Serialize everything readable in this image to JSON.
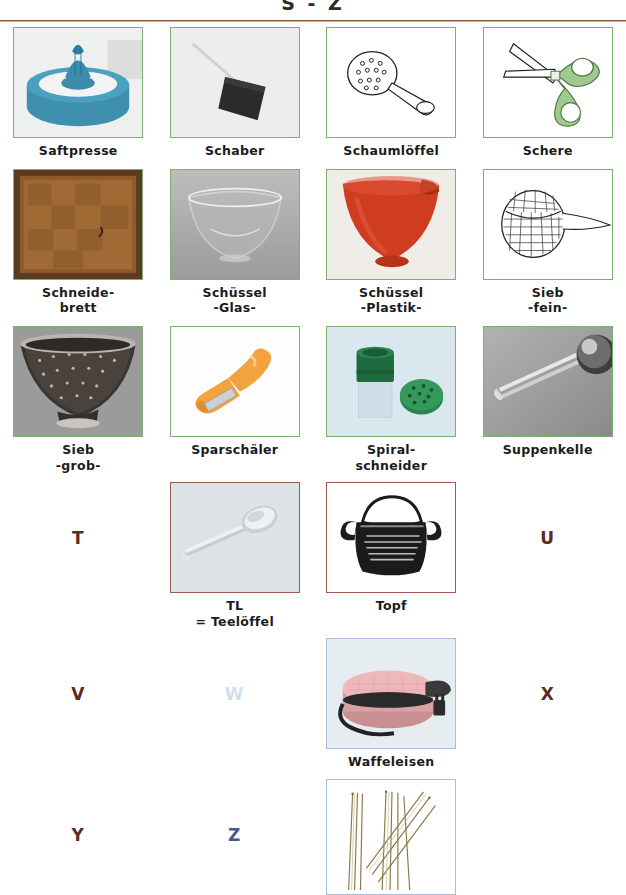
{
  "header": {
    "title": "S - Z"
  },
  "colors": {
    "frame_green": "#7fae74",
    "frame_brown": "#9c5b4e",
    "frame_blue": "#a8bed8",
    "rule_brown": "#8a5a3b",
    "letter_brown": "#5a2d22",
    "letter_blue_pale": "#cfe0f0",
    "letter_blue_dark": "#4a5a85",
    "caption_text": "#1b1b1b"
  },
  "rows": [
    {
      "cells": [
        {
          "kind": "image",
          "caption": "Saftpresse",
          "caption2": "",
          "border": "green",
          "art": "citrus-juicer"
        },
        {
          "kind": "image",
          "caption": "Schaber",
          "caption2": "",
          "border": "green",
          "art": "scraper"
        },
        {
          "kind": "image",
          "caption": "Schaumlöffel",
          "caption2": "",
          "border": "green",
          "art": "skimmer-spoon"
        },
        {
          "kind": "image",
          "caption": "Schere",
          "caption2": "",
          "border": "green",
          "art": "scissors"
        }
      ]
    },
    {
      "cells": [
        {
          "kind": "image",
          "caption": "Schneide-",
          "caption2": "brett",
          "border": "green",
          "art": "cutting-board"
        },
        {
          "kind": "image",
          "caption": "Schüssel",
          "caption2": "-Glas-",
          "border": "green",
          "art": "glass-bowl"
        },
        {
          "kind": "image",
          "caption": "Schüssel",
          "caption2": "-Plastik-",
          "border": "green",
          "art": "plastic-bowl"
        },
        {
          "kind": "image",
          "caption": "Sieb",
          "caption2": "-fein-",
          "border": "green",
          "art": "fine-sieve"
        }
      ]
    },
    {
      "cells": [
        {
          "kind": "image",
          "caption": "Sieb",
          "caption2": "-grob-",
          "border": "green",
          "art": "colander"
        },
        {
          "kind": "image",
          "caption": "Sparschäler",
          "caption2": "",
          "border": "green",
          "art": "peeler"
        },
        {
          "kind": "image",
          "caption": "Spiral-",
          "caption2": "schneider",
          "border": "green",
          "art": "spiral-cutter"
        },
        {
          "kind": "image",
          "caption": "Suppenkelle",
          "caption2": "",
          "border": "green",
          "art": "ladle"
        }
      ]
    },
    {
      "cells": [
        {
          "kind": "letter",
          "letter": "T",
          "color": "brown"
        },
        {
          "kind": "image",
          "caption": "TL",
          "caption2": "= Teelöffel",
          "border": "brown",
          "art": "teaspoon"
        },
        {
          "kind": "image",
          "caption": "Topf",
          "caption2": "",
          "border": "brown",
          "art": "pot"
        },
        {
          "kind": "letter",
          "letter": "U",
          "color": "brown"
        }
      ]
    },
    {
      "cells": [
        {
          "kind": "letter",
          "letter": "V",
          "color": "brown"
        },
        {
          "kind": "letter",
          "letter": "W",
          "color": "blue-pale"
        },
        {
          "kind": "image",
          "caption": "Waffeleisen",
          "caption2": "",
          "border": "blue",
          "art": "waffle-iron"
        },
        {
          "kind": "letter",
          "letter": "X",
          "color": "brown"
        }
      ]
    },
    {
      "cells": [
        {
          "kind": "letter",
          "letter": "Y",
          "color": "brown"
        },
        {
          "kind": "letter",
          "letter": "Z",
          "color": "blue-dark"
        },
        {
          "kind": "image",
          "caption": "",
          "caption2": "",
          "border": "blue",
          "art": "skewers"
        },
        {
          "kind": "empty"
        }
      ]
    }
  ]
}
